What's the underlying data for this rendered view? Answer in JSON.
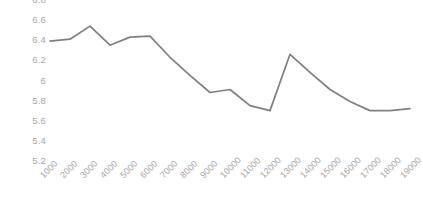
{
  "chart_data": {
    "type": "line",
    "title": "",
    "subtitle": "",
    "xlabel": "",
    "ylabel": "",
    "grid": false,
    "legend": "none",
    "line_color": "#808080",
    "axis_label_color": "#a6a6a6",
    "background": "#ffffff",
    "xlim": [
      1000,
      19000
    ],
    "ylim": [
      5.2,
      6.8
    ],
    "ytick_step": 0.2,
    "yticks": [
      "6.8",
      "6.6",
      "6.4",
      "6.2",
      "6",
      "5.8",
      "5.6",
      "5.4",
      "5.2"
    ],
    "ytick_values": [
      6.8,
      6.6,
      6.4,
      6.2,
      6.0,
      5.8,
      5.6,
      5.4,
      5.2
    ],
    "categories": [
      "1000",
      "2000",
      "3000",
      "4000",
      "5000",
      "6000",
      "7000",
      "8000",
      "9000",
      "10000",
      "11000",
      "12000",
      "13000",
      "14000",
      "15000",
      "16000",
      "17000",
      "18000",
      "19000"
    ],
    "values": [
      6.5,
      6.52,
      6.65,
      6.46,
      6.54,
      6.55,
      6.34,
      6.16,
      5.99,
      6.02,
      5.86,
      5.81,
      6.37,
      6.19,
      6.02,
      5.9,
      5.81,
      5.81,
      5.83
    ]
  }
}
